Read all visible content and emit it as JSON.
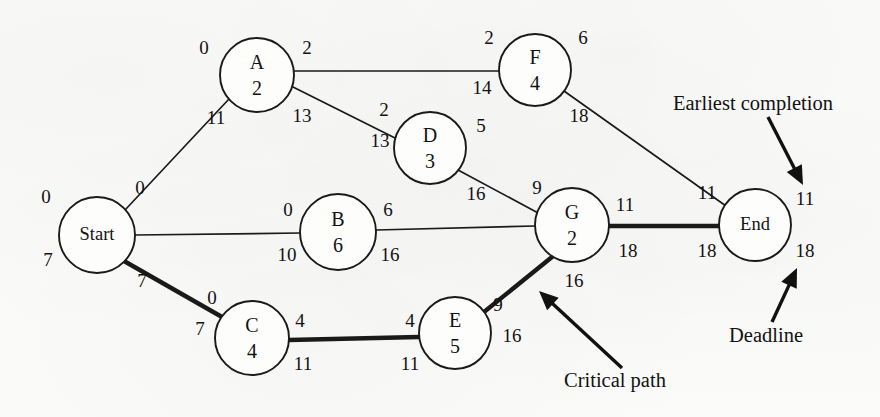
{
  "figure": {
    "type": "project-network-diagram",
    "background_color": "#fbfbfa",
    "ink_color": "#121212",
    "width": 880,
    "height": 417
  },
  "nodes": [
    {
      "id": "start",
      "name": "Start",
      "duration": "",
      "cx": 97,
      "cy": 235,
      "r": 38
    },
    {
      "id": "A",
      "name": "A",
      "duration": "2",
      "cx": 257,
      "cy": 75,
      "r": 37
    },
    {
      "id": "B",
      "name": "B",
      "duration": "6",
      "cx": 338,
      "cy": 232,
      "r": 38
    },
    {
      "id": "C",
      "name": "C",
      "duration": "4",
      "cx": 252,
      "cy": 338,
      "r": 37
    },
    {
      "id": "D",
      "name": "D",
      "duration": "3",
      "cx": 430,
      "cy": 148,
      "r": 36
    },
    {
      "id": "E",
      "name": "E",
      "duration": "5",
      "cx": 455,
      "cy": 333,
      "r": 36
    },
    {
      "id": "F",
      "name": "F",
      "duration": "4",
      "cx": 535,
      "cy": 70,
      "r": 36
    },
    {
      "id": "G",
      "name": "G",
      "duration": "2",
      "cx": 572,
      "cy": 225,
      "r": 37
    },
    {
      "id": "end",
      "name": "End",
      "duration": "",
      "cx": 755,
      "cy": 225,
      "r": 36
    }
  ],
  "edges": [
    {
      "id": "start-A",
      "from": "start",
      "to": "A",
      "critical": false,
      "x1": 125,
      "y1": 210,
      "x2": 229,
      "y2": 99
    },
    {
      "id": "start-B",
      "from": "start",
      "to": "B",
      "critical": false,
      "x1": 135,
      "y1": 235,
      "x2": 300,
      "y2": 233
    },
    {
      "id": "start-C",
      "from": "start",
      "to": "C",
      "critical": true,
      "x1": 124,
      "y1": 261,
      "x2": 222,
      "y2": 317
    },
    {
      "id": "A-F",
      "from": "A",
      "to": "F",
      "critical": false,
      "x1": 294,
      "y1": 71,
      "x2": 499,
      "y2": 71
    },
    {
      "id": "A-D",
      "from": "A",
      "to": "D",
      "critical": false,
      "x1": 291,
      "y1": 86,
      "x2": 397,
      "y2": 139
    },
    {
      "id": "D-G",
      "from": "D",
      "to": "G",
      "critical": false,
      "x1": 458,
      "y1": 170,
      "x2": 540,
      "y2": 214
    },
    {
      "id": "B-G",
      "from": "B",
      "to": "G",
      "critical": false,
      "x1": 376,
      "y1": 230,
      "x2": 535,
      "y2": 226
    },
    {
      "id": "C-E",
      "from": "C",
      "to": "E",
      "critical": true,
      "x1": 289,
      "y1": 340,
      "x2": 419,
      "y2": 337
    },
    {
      "id": "E-G",
      "from": "E",
      "to": "G",
      "critical": true,
      "x1": 484,
      "y1": 312,
      "x2": 552,
      "y2": 257
    },
    {
      "id": "F-End",
      "from": "F",
      "to": "end",
      "critical": false,
      "x1": 564,
      "y1": 91,
      "x2": 726,
      "y2": 206
    },
    {
      "id": "G-End",
      "from": "G",
      "to": "end",
      "critical": true,
      "x1": 609,
      "y1": 226,
      "x2": 719,
      "y2": 226
    }
  ],
  "time_labels": [
    {
      "id": "start-early-left",
      "node": "start",
      "value": "0",
      "x": 46,
      "y": 199
    },
    {
      "id": "start-late-left",
      "node": "start",
      "value": "7",
      "x": 48,
      "y": 262
    },
    {
      "id": "start-early-right",
      "node": "start",
      "value": "0",
      "x": 140,
      "y": 190
    },
    {
      "id": "start-late-right",
      "node": "start",
      "value": "7",
      "x": 142,
      "y": 283
    },
    {
      "id": "A-early-left",
      "node": "A",
      "value": "0",
      "x": 204,
      "y": 50
    },
    {
      "id": "A-early-right",
      "node": "A",
      "value": "2",
      "x": 307,
      "y": 50
    },
    {
      "id": "A-late-left",
      "node": "A",
      "value": "11",
      "x": 216,
      "y": 120
    },
    {
      "id": "A-late-right",
      "node": "A",
      "value": "13",
      "x": 302,
      "y": 118
    },
    {
      "id": "B-early-left",
      "node": "B",
      "value": "0",
      "x": 288,
      "y": 212
    },
    {
      "id": "B-early-right",
      "node": "B",
      "value": "6",
      "x": 388,
      "y": 212
    },
    {
      "id": "B-late-left",
      "node": "B",
      "value": "10",
      "x": 287,
      "y": 257
    },
    {
      "id": "B-late-right",
      "node": "B",
      "value": "16",
      "x": 390,
      "y": 257
    },
    {
      "id": "C-early-left",
      "node": "C",
      "value": "0",
      "x": 212,
      "y": 300
    },
    {
      "id": "C-early-right",
      "node": "C",
      "value": "4",
      "x": 300,
      "y": 323
    },
    {
      "id": "C-late-left",
      "node": "C",
      "value": "7",
      "x": 200,
      "y": 331
    },
    {
      "id": "C-late-right",
      "node": "C",
      "value": "11",
      "x": 303,
      "y": 366
    },
    {
      "id": "D-early-left",
      "node": "D",
      "value": "2",
      "x": 384,
      "y": 112
    },
    {
      "id": "D-early-right",
      "node": "D",
      "value": "5",
      "x": 481,
      "y": 128
    },
    {
      "id": "D-late-left",
      "node": "D",
      "value": "13",
      "x": 380,
      "y": 143
    },
    {
      "id": "D-late-right",
      "node": "D",
      "value": "16",
      "x": 476,
      "y": 196
    },
    {
      "id": "E-early-right",
      "node": "E",
      "value": "9",
      "x": 498,
      "y": 307
    },
    {
      "id": "E-early-left",
      "node": "E",
      "value": "4",
      "x": 410,
      "y": 323
    },
    {
      "id": "E-late-left",
      "node": "E",
      "value": "11",
      "x": 410,
      "y": 366
    },
    {
      "id": "E-late-right",
      "node": "E",
      "value": "16",
      "x": 512,
      "y": 338
    },
    {
      "id": "F-early-left",
      "node": "F",
      "value": "2",
      "x": 489,
      "y": 40
    },
    {
      "id": "F-early-right",
      "node": "F",
      "value": "6",
      "x": 583,
      "y": 40
    },
    {
      "id": "F-late-left",
      "node": "F",
      "value": "14",
      "x": 482,
      "y": 90
    },
    {
      "id": "F-late-right",
      "node": "F",
      "value": "18",
      "x": 579,
      "y": 118
    },
    {
      "id": "G-early-left",
      "node": "G",
      "value": "9",
      "x": 537,
      "y": 190
    },
    {
      "id": "G-early-right",
      "node": "G",
      "value": "11",
      "x": 625,
      "y": 207
    },
    {
      "id": "G-late-left",
      "node": "G",
      "value": "16",
      "x": 574,
      "y": 283
    },
    {
      "id": "G-late-right",
      "node": "G",
      "value": "18",
      "x": 628,
      "y": 253
    },
    {
      "id": "End-early-left",
      "node": "end",
      "value": "11",
      "x": 707,
      "y": 195
    },
    {
      "id": "End-early-right",
      "node": "end",
      "value": "11",
      "x": 805,
      "y": 201
    },
    {
      "id": "End-late-left",
      "node": "end",
      "value": "18",
      "x": 707,
      "y": 253
    },
    {
      "id": "End-late-right",
      "node": "end",
      "value": "18",
      "x": 805,
      "y": 253
    }
  ],
  "annotations": [
    {
      "id": "earliest-completion",
      "label": "Earliest completion",
      "text_x": 673,
      "text_y": 105,
      "arrow": {
        "x1": 768,
        "y1": 117,
        "x2": 803,
        "y2": 185
      }
    },
    {
      "id": "deadline",
      "label": "Deadline",
      "text_x": 729,
      "text_y": 337,
      "arrow": {
        "x1": 772,
        "y1": 322,
        "x2": 797,
        "y2": 268
      }
    },
    {
      "id": "critical-path",
      "label": "Critical path",
      "text_x": 564,
      "text_y": 382,
      "arrow": {
        "x1": 622,
        "y1": 368,
        "x2": 539,
        "y2": 291
      }
    }
  ]
}
